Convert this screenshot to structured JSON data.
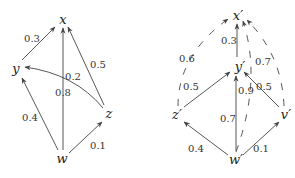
{
  "diagrams": [
    {
      "id": "left",
      "nodes": [
        {
          "id": "x",
          "label": "x",
          "x": 63,
          "y": 20
        },
        {
          "id": "y",
          "label": "y",
          "x": 16,
          "y": 70
        },
        {
          "id": "z",
          "label": "z",
          "x": 108,
          "y": 114
        },
        {
          "id": "w",
          "label": "w",
          "x": 62,
          "y": 160
        }
      ],
      "edges": [
        {
          "from": "y",
          "to": "x",
          "weight": "0.3",
          "style": "solid",
          "label_x": 32,
          "label_y": 40
        },
        {
          "from": "w",
          "to": "x",
          "weight": "0.8",
          "style": "solid",
          "label_x": 63,
          "label_y": 93
        },
        {
          "from": "z",
          "to": "x",
          "weight": "0.5",
          "style": "solid",
          "label_x": 98,
          "label_y": 66
        },
        {
          "from": "z",
          "to": "y",
          "weight": "0.2",
          "style": "solid-curved",
          "label_x": 73,
          "label_y": 77
        },
        {
          "from": "w",
          "to": "y",
          "weight": "0.4",
          "style": "solid",
          "label_x": 30,
          "label_y": 119
        },
        {
          "from": "w",
          "to": "z",
          "weight": "0.1",
          "style": "solid",
          "label_x": 98,
          "label_y": 147
        }
      ]
    },
    {
      "id": "right",
      "nodes": [
        {
          "id": "x'",
          "label": "x′",
          "x": 238,
          "y": 17
        },
        {
          "id": "y'",
          "label": "y′",
          "x": 240,
          "y": 68
        },
        {
          "id": "z'",
          "label": "z′",
          "x": 177,
          "y": 116
        },
        {
          "id": "v'",
          "label": "v′",
          "x": 286,
          "y": 116
        },
        {
          "id": "w'",
          "label": "w′",
          "x": 236,
          "y": 161
        }
      ],
      "edges": [
        {
          "from": "y'",
          "to": "x'",
          "weight": "0.3",
          "style": "solid",
          "label_x": 229,
          "label_y": 42
        },
        {
          "from": "z'",
          "to": "y'",
          "weight": "0.5",
          "style": "solid",
          "label_x": 191,
          "label_y": 88
        },
        {
          "from": "w'",
          "to": "y'",
          "weight": "0.7",
          "style": "solid",
          "label_x": 228,
          "label_y": 120
        },
        {
          "from": "v'",
          "to": "y'",
          "weight": "0.5",
          "style": "solid",
          "label_x": 262,
          "label_y": 88
        },
        {
          "from": "w'",
          "to": "z'",
          "weight": "0.4",
          "style": "solid",
          "label_x": 189,
          "label_y": 150
        },
        {
          "from": "w'",
          "to": "v'",
          "weight": "0.1",
          "style": "solid",
          "label_x": 261,
          "label_y": 150
        },
        {
          "from": "z'",
          "to": "x'",
          "weight": "0.6",
          "style": "dashed",
          "label_x": 187,
          "label_y": 60
        },
        {
          "from": "v'",
          "to": "x'",
          "weight": "0.7",
          "style": "dashed",
          "label_x": 264,
          "label_y": 63
        },
        {
          "from": "w'",
          "to": "x'",
          "weight": "0.9",
          "style": "dashed",
          "label_x": 244,
          "label_y": 92
        }
      ]
    }
  ]
}
